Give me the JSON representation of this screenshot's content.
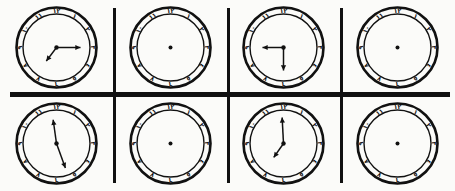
{
  "image": {
    "title": "Grid of eight analog clock faces",
    "background_color": "#fbfbf9",
    "ink_color": "#111111",
    "width": 455,
    "height": 191,
    "grid_rows": 2,
    "grid_cols": 4
  },
  "clock_face": {
    "numeral_system": "eastern-arabic-indic",
    "numerals": [
      "١٢",
      "١",
      "٢",
      "٣",
      "٤",
      "٥",
      "٦",
      "٧",
      "٨",
      "٩",
      "١٠",
      "١١"
    ],
    "numeral_values": [
      12,
      1,
      2,
      3,
      4,
      5,
      6,
      7,
      8,
      9,
      10,
      11
    ],
    "has_outer_ring": true,
    "has_center_dot": true,
    "hand_tip": "arrowhead"
  },
  "separators": {
    "vertical": [
      {
        "name": "v-sep-1",
        "x": 113,
        "y": 8,
        "height": 175
      },
      {
        "name": "v-sep-2",
        "x": 227,
        "y": 8,
        "height": 175
      },
      {
        "name": "v-sep-3",
        "x": 340,
        "y": 8,
        "height": 175
      }
    ],
    "horizontal": [
      {
        "name": "h-sep-1",
        "x": 10,
        "y": 92,
        "width": 440
      }
    ]
  },
  "clocks": [
    {
      "id": "clock-1",
      "position": "row1-col1",
      "row": 1,
      "col": 1,
      "has_hands": true,
      "reading": "7:15",
      "hour_angle_deg": 217,
      "minute_angle_deg": 90,
      "hour_hand_length": 17,
      "minute_hand_length": 24
    },
    {
      "id": "clock-2",
      "position": "row1-col2",
      "row": 1,
      "col": 2,
      "has_hands": false,
      "reading": "",
      "hour_angle_deg": null,
      "minute_angle_deg": null,
      "hour_hand_length": 0,
      "minute_hand_length": 0
    },
    {
      "id": "clock-3",
      "position": "row1-col3",
      "row": 1,
      "col": 3,
      "has_hands": true,
      "reading": "9:30",
      "hour_angle_deg": 270,
      "minute_angle_deg": 180,
      "hour_hand_length": 21,
      "minute_hand_length": 23
    },
    {
      "id": "clock-4",
      "position": "row1-col4",
      "row": 1,
      "col": 4,
      "has_hands": false,
      "reading": "",
      "hour_angle_deg": null,
      "minute_angle_deg": null,
      "hour_hand_length": 0,
      "minute_hand_length": 0
    },
    {
      "id": "clock-5",
      "position": "row2-col1",
      "row": 2,
      "col": 1,
      "has_hands": true,
      "reading": "11:25",
      "hour_angle_deg": 352,
      "minute_angle_deg": 160,
      "hour_hand_length": 24,
      "minute_hand_length": 26
    },
    {
      "id": "clock-6",
      "position": "row2-col2",
      "row": 2,
      "col": 2,
      "has_hands": false,
      "reading": "",
      "hour_angle_deg": null,
      "minute_angle_deg": null,
      "hour_hand_length": 0,
      "minute_hand_length": 0
    },
    {
      "id": "clock-7",
      "position": "row2-col3",
      "row": 2,
      "col": 3,
      "has_hands": true,
      "reading": "7:00",
      "hour_angle_deg": 215,
      "minute_angle_deg": 357,
      "hour_hand_length": 17,
      "minute_hand_length": 26
    },
    {
      "id": "clock-8",
      "position": "row2-col4",
      "row": 2,
      "col": 4,
      "has_hands": false,
      "reading": "",
      "hour_angle_deg": null,
      "minute_angle_deg": null,
      "hour_hand_length": 0,
      "minute_hand_length": 0
    }
  ]
}
